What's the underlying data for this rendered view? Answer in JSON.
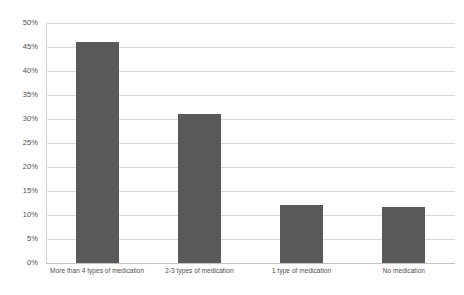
{
  "chart_data": {
    "type": "bar",
    "title": "",
    "subtitle": "",
    "xlabel": "",
    "ylabel": "",
    "categories": [
      "More than 4 types of medication",
      "2-3 types of medication",
      "1 type of medication",
      "No medication"
    ],
    "values": [
      46,
      31,
      12,
      11.7
    ],
    "value_labels": [
      "46%",
      "31%",
      "12%",
      "11.7%"
    ],
    "ylim": [
      0,
      50
    ],
    "ytick_values": [
      0,
      5,
      10,
      15,
      20,
      25,
      30,
      35,
      40,
      45,
      50
    ],
    "ytick_labels": [
      "0%",
      "5%",
      "10%",
      "15%",
      "20%",
      "25%",
      "30%",
      "35%",
      "40%",
      "45%",
      "50%"
    ],
    "grid": true,
    "grid_axis": "y",
    "legend": false,
    "legend_position": "none",
    "bar_color": "#595959",
    "gridline_color": "#d9d9d9",
    "axis_color": "#d0d0d0",
    "label_color": "#4d4d4d",
    "background_color": "#ffffff",
    "annotations": []
  }
}
